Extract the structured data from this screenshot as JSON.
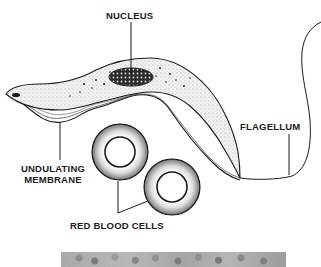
{
  "diagram": {
    "labels": {
      "nucleus": "NUCLEUS",
      "flagellum": "FLAGELLUM",
      "undulating_membrane_line1": "UNDULATING",
      "undulating_membrane_line2": "MEMBRANE",
      "red_blood_cells": "RED BLOOD CELLS"
    },
    "colors": {
      "ink": "#1a1a1a",
      "stipple": "#d9d9d9",
      "background": "#ffffff",
      "photo_strip": "#a8a8a8"
    }
  }
}
